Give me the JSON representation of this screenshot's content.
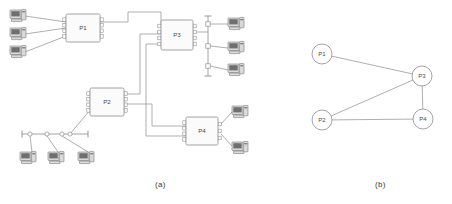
{
  "figure": {
    "panels": [
      {
        "id": "a",
        "caption": "(a)",
        "x": 155,
        "y": 180
      },
      {
        "id": "b",
        "caption": "(b)",
        "x": 375,
        "y": 180
      }
    ]
  },
  "colors": {
    "line": "#8d8d8d",
    "box_fill": "#fbfbfb",
    "box_stroke": "#8d8d8d",
    "text": "#4a4a4a",
    "caption": "#3a3a3a",
    "host_body": "#d9d9d9",
    "host_screen": "#6f6f6f",
    "host_stroke": "#7a7a7a",
    "background": "#ffffff"
  },
  "panel_a": {
    "routers": [
      {
        "name": "P1",
        "x": 66,
        "y": 14,
        "w": 34,
        "h": 28,
        "left_ports": 4,
        "right_ports": 4
      },
      {
        "name": "P2",
        "x": 90,
        "y": 88,
        "w": 34,
        "h": 28,
        "left_ports": 4,
        "right_ports": 4
      },
      {
        "name": "P3",
        "x": 161,
        "y": 20,
        "w": 32,
        "h": 30,
        "left_ports": 4,
        "right_ports": 4
      },
      {
        "name": "P4",
        "x": 186,
        "y": 117,
        "w": 32,
        "h": 28,
        "left_ports": 4,
        "right_ports": 3
      }
    ],
    "hosts": [
      {
        "id": "h1",
        "x": 10,
        "y": 10,
        "attaches_to": "P1"
      },
      {
        "id": "h2",
        "x": 10,
        "y": 28,
        "attaches_to": "P1"
      },
      {
        "id": "h3",
        "x": 10,
        "y": 46,
        "attaches_to": "P1"
      },
      {
        "id": "h4",
        "x": 228,
        "y": 18,
        "attaches_to": "bus-vertical"
      },
      {
        "id": "h5",
        "x": 228,
        "y": 42,
        "attaches_to": "bus-vertical"
      },
      {
        "id": "h6",
        "x": 228,
        "y": 64,
        "attaches_to": "bus-vertical"
      },
      {
        "id": "h7",
        "x": 20,
        "y": 152,
        "attaches_to": "bus-horizontal"
      },
      {
        "id": "h8",
        "x": 48,
        "y": 152,
        "attaches_to": "bus-horizontal"
      },
      {
        "id": "h9",
        "x": 78,
        "y": 152,
        "attaches_to": "bus-horizontal"
      },
      {
        "id": "h10",
        "x": 232,
        "y": 106,
        "attaches_to": "P4"
      },
      {
        "id": "h11",
        "x": 232,
        "y": 142,
        "attaches_to": "P4"
      }
    ],
    "buses": [
      {
        "id": "bus-vertical",
        "orientation": "vertical",
        "x": 208,
        "y1": 16,
        "y2": 76,
        "taps": 3
      },
      {
        "id": "bus-horizontal",
        "orientation": "horizontal",
        "y": 134,
        "x1": 22,
        "x2": 88,
        "taps": 4
      }
    ],
    "links": [
      {
        "from": "P1",
        "to": "P3"
      },
      {
        "from": "P2",
        "to": "P3"
      },
      {
        "from": "P2",
        "to": "P4"
      },
      {
        "from": "P3",
        "to": "P4"
      },
      {
        "from": "P3",
        "to": "bus-vertical"
      },
      {
        "from": "P2",
        "to": "bus-horizontal"
      }
    ]
  },
  "panel_b": {
    "nodes": [
      {
        "id": "P1",
        "label": "P1",
        "cx": 322,
        "cy": 54,
        "r": 10
      },
      {
        "id": "P2",
        "label": "P2",
        "cx": 322,
        "cy": 120,
        "r": 10
      },
      {
        "id": "P3",
        "label": "P3",
        "cx": 422,
        "cy": 76,
        "r": 10
      },
      {
        "id": "P4",
        "label": "P4",
        "cx": 423,
        "cy": 119,
        "r": 10
      }
    ],
    "edges": [
      {
        "from": "P1",
        "to": "P3"
      },
      {
        "from": "P2",
        "to": "P3"
      },
      {
        "from": "P3",
        "to": "P4"
      },
      {
        "from": "P2",
        "to": "P4"
      }
    ]
  }
}
